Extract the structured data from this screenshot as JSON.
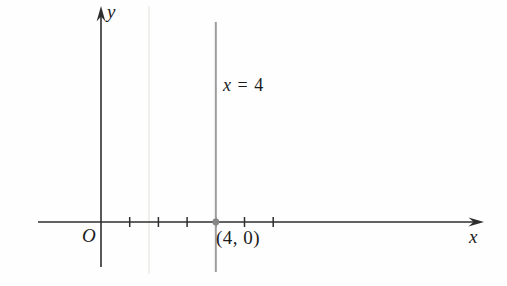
{
  "figure": {
    "labels": {
      "y_axis": "y",
      "x_axis": "x",
      "origin": "O",
      "line_var": "x",
      "line_eq": " = 4",
      "point": "(4, 0)"
    },
    "colors": {
      "background": "#fefefe",
      "axis": "#2e2e2e",
      "vertical_line": "#9d9d9d",
      "point_dot": "#868686",
      "scan_artifact": "#f0efeb",
      "text": "#1c1c1c"
    },
    "geometry": {
      "canvas": {
        "width": 507,
        "height": 286
      },
      "origin_px": {
        "x": 101,
        "y": 222
      },
      "unit_px": 28.7,
      "y_axis": {
        "x": 101,
        "line_top": 14,
        "bottom": 267,
        "arrow_tip_y": 6
      },
      "x_axis": {
        "y": 222,
        "left": 38,
        "line_end": 474,
        "arrow_tip_x": 484
      },
      "tick_units": [
        1,
        2,
        3,
        4,
        5,
        6
      ],
      "tick_half_height": 5,
      "vertical_line": {
        "x": 215.8,
        "top": 22,
        "bottom": 272,
        "width": 2
      },
      "point_dot": {
        "x": 215.8,
        "y": 222,
        "r": 3.4
      },
      "scan_artifact": {
        "x": 149,
        "top": 6,
        "bottom": 274,
        "width": 2
      }
    }
  },
  "chart_data": {
    "type": "line",
    "title": "",
    "equation": "x = 4",
    "line": {
      "kind": "vertical",
      "x": 4
    },
    "highlighted_point": {
      "x": 4,
      "y": 0,
      "label": "(4, 0)"
    },
    "x_ticks": [
      1,
      2,
      3,
      4,
      5,
      6
    ],
    "y_ticks": [],
    "axis_labels": {
      "x": "x",
      "y": "y",
      "origin": "O"
    },
    "xlim": [
      -2.2,
      13.3
    ],
    "ylim": [
      -2.2,
      7.5
    ],
    "grid": false,
    "legend": "none"
  }
}
